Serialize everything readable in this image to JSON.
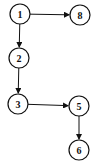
{
  "diagram": {
    "type": "directed-graph",
    "nodes": [
      {
        "id": "1",
        "label": "1",
        "cx": 20,
        "cy": 14
      },
      {
        "id": "8",
        "label": "8",
        "cx": 80,
        "cy": 15
      },
      {
        "id": "2",
        "label": "2",
        "cx": 19,
        "cy": 58
      },
      {
        "id": "3",
        "label": "3",
        "cx": 18,
        "cy": 104
      },
      {
        "id": "5",
        "label": "5",
        "cx": 79,
        "cy": 106
      },
      {
        "id": "6",
        "label": "6",
        "cx": 79,
        "cy": 150
      }
    ],
    "edges": [
      {
        "from": "1",
        "to": "8"
      },
      {
        "from": "1",
        "to": "2"
      },
      {
        "from": "2",
        "to": "3"
      },
      {
        "from": "3",
        "to": "5"
      },
      {
        "from": "5",
        "to": "6"
      }
    ],
    "colors": {
      "stroke": "#111111",
      "background": "#ffffff"
    }
  }
}
